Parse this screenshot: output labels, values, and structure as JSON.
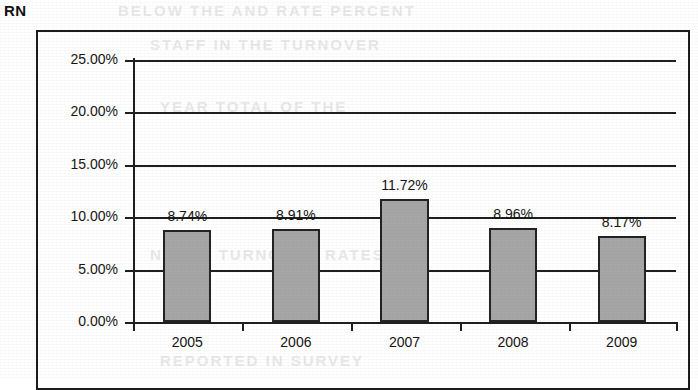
{
  "chart_title": "RN",
  "chart_data": {
    "type": "bar",
    "title": "RN",
    "xlabel": "",
    "ylabel": "",
    "categories": [
      "2005",
      "2006",
      "2007",
      "2008",
      "2009"
    ],
    "values": [
      8.74,
      8.91,
      11.72,
      8.96,
      8.17
    ],
    "data_labels": [
      "8.74%",
      "8.91%",
      "11.72%",
      "8.96%",
      "8.17%"
    ],
    "ylim": [
      0,
      25
    ],
    "ytick_labels": [
      "25.00%",
      "20.00%",
      "15.00%",
      "10.00%",
      "5.00%",
      "0.00%"
    ],
    "ytick_values": [
      25,
      20,
      15,
      10,
      5,
      0
    ],
    "grid": true,
    "legend": "none",
    "series_name": "RN",
    "bar_color": "#a6a6a6",
    "bar_border_color": "#232323",
    "axis_color": "#1f1f1f",
    "background_color": "#ffffff"
  },
  "ghost_text": {
    "row1": "BELOW  THE  AND  RATE  PERCENT",
    "row2": "STAFF  IN  THE  TURNOVER",
    "row3": "YEAR  TOTAL  OF  THE",
    "row4": "NURSE  TURNOVER  RATES",
    "row5": "REPORTED  IN  SURVEY"
  }
}
